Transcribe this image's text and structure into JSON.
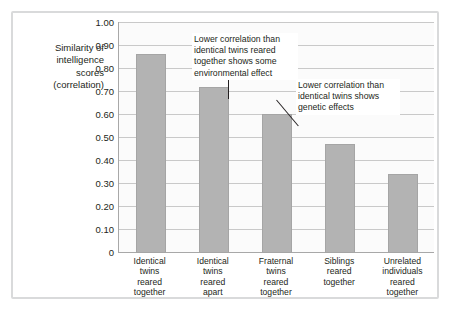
{
  "chart_data": {
    "type": "bar",
    "title": "",
    "subtitle": "",
    "xlabel": "",
    "ylabel": "Similarity of intelligence scores (correlation)",
    "ylabel_lines": [
      "Similarity of",
      "intelligence",
      "scores",
      "(correlation)"
    ],
    "categories": [
      "Identical twins reared together",
      "Identical twins reared apart",
      "Fraternal twins reared together",
      "Siblings reared together",
      "Unrelated individuals reared together"
    ],
    "category_lines": [
      [
        "Identical",
        "twins",
        "reared",
        "together"
      ],
      [
        "Identical",
        "twins",
        "reared",
        "apart"
      ],
      [
        "Fraternal",
        "twins",
        "reared",
        "together"
      ],
      [
        "Siblings",
        "reared",
        "together"
      ],
      [
        "Unrelated",
        "individuals",
        "reared",
        "together"
      ]
    ],
    "values": [
      0.86,
      0.72,
      0.6,
      0.47,
      0.34
    ],
    "ylim": [
      0,
      1.0
    ],
    "ytick_labels": [
      "1.00",
      "0.90",
      "0.80",
      "0.70",
      "0.60",
      "0.50",
      "0.40",
      "0.30",
      "0.20",
      "0.10",
      "0"
    ],
    "ytick_values": [
      1.0,
      0.9,
      0.8,
      0.7,
      0.6,
      0.5,
      0.4,
      0.3,
      0.2,
      0.1,
      0
    ],
    "grid": true,
    "legend": false,
    "bar_color": "#b3b3b3",
    "gridline_color": "#c9c9c9",
    "text_color": "#231f20",
    "annotations": [
      {
        "id": "annotation-1",
        "lines": [
          "Lower correlation than",
          "identical twins reared",
          "together shows some",
          "environmental effect"
        ],
        "points_to_category": "Identical twins reared apart"
      },
      {
        "id": "annotation-2",
        "lines": [
          "Lower correlation than",
          "identical twins shows",
          "genetic effects"
        ],
        "points_to_category": "Fraternal twins reared together"
      }
    ]
  }
}
